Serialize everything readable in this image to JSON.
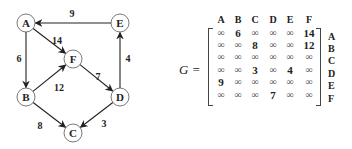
{
  "graph": {
    "nodes": [
      {
        "id": "A",
        "label": "A",
        "x": 26,
        "y": 23
      },
      {
        "id": "E",
        "label": "E",
        "x": 120,
        "y": 23
      },
      {
        "id": "F",
        "label": "F",
        "x": 73,
        "y": 59
      },
      {
        "id": "B",
        "label": "B",
        "x": 26,
        "y": 97
      },
      {
        "id": "D",
        "label": "D",
        "x": 120,
        "y": 97
      },
      {
        "id": "C",
        "label": "C",
        "x": 73,
        "y": 133
      }
    ],
    "edges": [
      {
        "from": "E",
        "to": "A",
        "weight": "9",
        "label_x": 72,
        "label_y": 17
      },
      {
        "from": "A",
        "to": "F",
        "weight": "14",
        "label_x": 57,
        "label_y": 44
      },
      {
        "from": "A",
        "to": "B",
        "weight": "6",
        "label_x": 19,
        "label_y": 62
      },
      {
        "from": "B",
        "to": "F",
        "weight": "12",
        "label_x": 59,
        "label_y": 91
      },
      {
        "from": "F",
        "to": "D",
        "weight": "7",
        "label_x": 98,
        "label_y": 80
      },
      {
        "from": "D",
        "to": "E",
        "weight": "4",
        "label_x": 128,
        "label_y": 62
      },
      {
        "from": "B",
        "to": "C",
        "weight": "8",
        "label_x": 40,
        "label_y": 129
      },
      {
        "from": "D",
        "to": "C",
        "weight": "3",
        "label_x": 104,
        "label_y": 127
      }
    ]
  },
  "matrix": {
    "name": "G =",
    "col_headers": [
      "A",
      "B",
      "C",
      "D",
      "E",
      "F"
    ],
    "row_headers": [
      "A",
      "B",
      "C",
      "D",
      "E",
      "F"
    ],
    "rows": [
      [
        "∞",
        "6",
        "∞",
        "∞",
        "∞",
        "14"
      ],
      [
        "∞",
        "∞",
        "8",
        "∞",
        "∞",
        "12"
      ],
      [
        "∞",
        "∞",
        "∞",
        "∞",
        "∞",
        "∞"
      ],
      [
        "∞",
        "∞",
        "3",
        "∞",
        "4",
        "∞"
      ],
      [
        "9",
        "∞",
        "∞",
        "∞",
        "∞",
        "∞"
      ],
      [
        "∞",
        "∞",
        "∞",
        "7",
        "∞",
        "∞"
      ]
    ]
  }
}
